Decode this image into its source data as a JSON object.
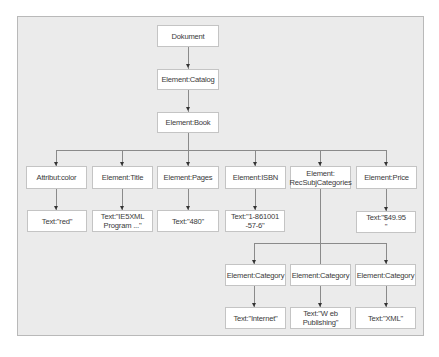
{
  "diagram": {
    "type": "xml-dom-tree",
    "root": {
      "label": "Dokument"
    },
    "level1": {
      "label": "Element:Catalog"
    },
    "level2": {
      "label": "Element:Book"
    },
    "book_children": [
      {
        "label": "Attribut:color",
        "child": "Text:\"red\""
      },
      {
        "label": "Element:Title",
        "child": "Text:\"IE5XML\nProgram ...\""
      },
      {
        "label": "Element:Pages",
        "child": "Text:\"480\""
      },
      {
        "label": "Element:ISBN",
        "child": "Text:\"1-861001\n-57-6\""
      },
      {
        "label": "Element:\nRecSubjCategories",
        "child": null
      },
      {
        "label": "Element:Price",
        "child": "Text:\"$49.95\n\""
      }
    ],
    "categories": [
      {
        "label": "Element:Category",
        "child": "Text:\"Internet\""
      },
      {
        "label": "Element:Category",
        "child": "Text:\"W eb\nPublishing\""
      },
      {
        "label": "Element:Category",
        "child": "Text:\"XML\""
      }
    ]
  },
  "colors": {
    "background": "#ebebeb",
    "node_fill": "#ffffff",
    "node_border": "#c4c4c4",
    "connector": "#8a8a8a"
  }
}
